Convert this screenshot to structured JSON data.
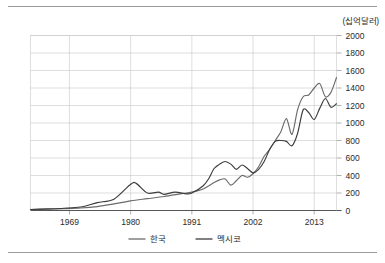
{
  "unit_label": "(십억달러)",
  "chart_data": {
    "type": "line",
    "title": "",
    "xlabel": "",
    "ylabel": "",
    "unit": "십억달러",
    "xlim": [
      1962,
      2017
    ],
    "ylim": [
      0,
      2000
    ],
    "ytick_step": 200,
    "yticks": [
      0,
      200,
      400,
      600,
      800,
      1000,
      1200,
      1400,
      1600,
      1800,
      2000
    ],
    "xticks": [
      1969,
      1980,
      1991,
      2002,
      2013
    ],
    "xtick_labels": [
      "1969",
      "1980",
      "1991",
      "2002",
      "2013"
    ],
    "grid": true,
    "legend_position": "bottom-center",
    "series": [
      {
        "name": "한국",
        "color": "#6b6b6b",
        "x": [
          1962,
          1965,
          1968,
          1971,
          1974,
          1977,
          1980,
          1983,
          1986,
          1989,
          1991,
          1993,
          1995,
          1996,
          1997,
          1998,
          1999,
          2000,
          2001,
          2002,
          2003,
          2004,
          2005,
          2006,
          2007,
          2008,
          2009,
          2010,
          2011,
          2012,
          2013,
          2014,
          2015,
          2016,
          2017
        ],
        "values": [
          10,
          14,
          20,
          28,
          45,
          75,
          110,
          135,
          160,
          190,
          210,
          245,
          320,
          350,
          360,
          290,
          340,
          400,
          380,
          420,
          500,
          620,
          700,
          800,
          900,
          1050,
          870,
          1150,
          1300,
          1320,
          1400,
          1450,
          1300,
          1350,
          1520
        ]
      },
      {
        "name": "멕시코",
        "color": "#3c3c3c",
        "x": [
          1962,
          1965,
          1968,
          1971,
          1974,
          1977,
          1980,
          1981,
          1983,
          1985,
          1986,
          1988,
          1990,
          1991,
          1993,
          1994,
          1995,
          1996,
          1997,
          1998,
          1999,
          2000,
          2001,
          2002,
          2003,
          2004,
          2005,
          2006,
          2007,
          2008,
          2009,
          2010,
          2011,
          2012,
          2013,
          2014,
          2015,
          2016,
          2017
        ],
        "values": [
          12,
          18,
          26,
          40,
          90,
          130,
          300,
          310,
          200,
          210,
          185,
          210,
          190,
          200,
          280,
          360,
          480,
          530,
          560,
          530,
          470,
          520,
          480,
          430,
          470,
          560,
          700,
          790,
          800,
          790,
          740,
          880,
          1150,
          1120,
          1040,
          1170,
          1280,
          1180,
          1220
        ]
      }
    ],
    "legend": [
      {
        "label": "한국",
        "color": "#6b6b6b"
      },
      {
        "label": "멕시코",
        "color": "#3c3c3c"
      }
    ]
  }
}
